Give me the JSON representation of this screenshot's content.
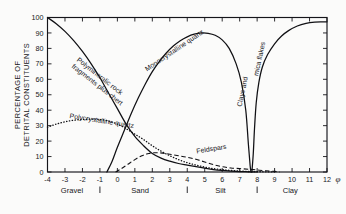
{
  "chart_data": {
    "type": "line",
    "title": "",
    "xlabel": "φ",
    "ylabel": "PERCENTAGE OF DETRITAL CONSTITUENTS",
    "ylabel_line1": "PERCENTAGE OF",
    "ylabel_line2": "DETRITAL CONSTITUENTS",
    "xlim": [
      -4,
      12
    ],
    "ylim": [
      0,
      100
    ],
    "xticks": [
      -4,
      -3,
      -2,
      -1,
      0,
      1,
      2,
      3,
      4,
      5,
      6,
      7,
      8,
      9,
      10,
      11,
      12
    ],
    "xtick_labels": [
      "-4",
      "-3",
      "-2",
      "-1",
      "0",
      "1",
      "2",
      "3",
      "4",
      "5",
      "6",
      "7",
      "8",
      "9",
      "10",
      "11",
      "12"
    ],
    "yticks": [
      0,
      10,
      20,
      30,
      40,
      50,
      60,
      70,
      80,
      90,
      100
    ],
    "ytick_labels": [
      "0",
      "10",
      "20",
      "30",
      "40",
      "50",
      "60",
      "70",
      "80",
      "90",
      "100"
    ],
    "grid": false,
    "legend": "inline-curve-labels",
    "size_classes": [
      {
        "name": "Gravel",
        "phi_from": -4,
        "phi_to": -1,
        "label_phi": -2.6
      },
      {
        "name": "Sand",
        "phi_from": -1,
        "phi_to": 4,
        "label_phi": 1.3
      },
      {
        "name": "Silt",
        "phi_from": 4,
        "phi_to": 8,
        "label_phi": 5.9
      },
      {
        "name": "Clay",
        "phi_from": 8,
        "phi_to": 12,
        "label_phi": 9.9
      }
    ],
    "series": [
      {
        "name": "Polymineralic rock fragments plus chert",
        "style": "solid",
        "label_lines": [
          "Polymineralic rock",
          "fragments plus chert"
        ],
        "label_phi": -2.35,
        "label_pct": 72,
        "label_rotation": 38,
        "points": [
          [
            -4,
            100
          ],
          [
            -3.5,
            96
          ],
          [
            -3,
            91
          ],
          [
            -2.5,
            85
          ],
          [
            -2,
            78
          ],
          [
            -1.5,
            70
          ],
          [
            -1,
            61
          ],
          [
            -0.5,
            51
          ],
          [
            0,
            41
          ],
          [
            0.5,
            31
          ],
          [
            1,
            23
          ],
          [
            1.5,
            17
          ],
          [
            2,
            12
          ],
          [
            2.5,
            9
          ],
          [
            3,
            7
          ],
          [
            3.5,
            5.5
          ],
          [
            4,
            4.5
          ],
          [
            4.5,
            3.5
          ],
          [
            5,
            2.5
          ],
          [
            5.5,
            1.6
          ],
          [
            6,
            1.0
          ],
          [
            6.5,
            0.6
          ],
          [
            7,
            0.3
          ],
          [
            7.5,
            0.15
          ],
          [
            8,
            0
          ]
        ]
      },
      {
        "name": "Monocrystalline quartz",
        "style": "solid",
        "label_lines": [
          "Monocrystalline quartz"
        ],
        "label_phi": 1.7,
        "label_pct": 65,
        "label_rotation": -34,
        "points": [
          [
            -0.6,
            0
          ],
          [
            -0.3,
            7
          ],
          [
            0,
            16
          ],
          [
            0.4,
            27
          ],
          [
            0.8,
            38
          ],
          [
            1.2,
            48
          ],
          [
            1.6,
            57
          ],
          [
            2,
            65
          ],
          [
            2.4,
            71.5
          ],
          [
            2.8,
            77
          ],
          [
            3.2,
            81.5
          ],
          [
            3.6,
            85
          ],
          [
            4,
            87.5
          ],
          [
            4.4,
            89.2
          ],
          [
            4.8,
            90
          ],
          [
            5.2,
            89.8
          ],
          [
            5.6,
            88.5
          ],
          [
            6,
            85.5
          ],
          [
            6.4,
            80
          ],
          [
            6.8,
            70
          ],
          [
            7.1,
            58
          ],
          [
            7.35,
            40
          ],
          [
            7.5,
            18
          ],
          [
            7.6,
            4
          ],
          [
            7.65,
            0
          ]
        ]
      },
      {
        "name": "Polycrystalline quartz",
        "style": "dotted",
        "label_lines": [
          "Polycrystalline quartz"
        ],
        "label_phi": -2.75,
        "label_pct": 35,
        "label_rotation": 9,
        "points": [
          [
            -4,
            29
          ],
          [
            -3.5,
            31
          ],
          [
            -3,
            32.5
          ],
          [
            -2.5,
            33.5
          ],
          [
            -2,
            34
          ],
          [
            -1.5,
            34.2
          ],
          [
            -1,
            34
          ],
          [
            -0.5,
            33
          ],
          [
            0,
            31
          ],
          [
            0.5,
            28
          ],
          [
            1,
            24.5
          ],
          [
            1.5,
            21
          ],
          [
            2,
            17
          ],
          [
            2.5,
            13.5
          ],
          [
            3,
            10.5
          ],
          [
            3.5,
            8
          ],
          [
            4,
            6
          ],
          [
            4.5,
            4.5
          ],
          [
            5,
            3.2
          ],
          [
            5.5,
            2.2
          ],
          [
            6,
            1.5
          ],
          [
            6.5,
            1.0
          ],
          [
            7,
            0.6
          ],
          [
            7.5,
            0.35
          ],
          [
            8,
            0.2
          ],
          [
            8.5,
            0.1
          ],
          [
            9,
            0
          ]
        ]
      },
      {
        "name": "Feldspars",
        "style": "dashed",
        "label_lines": [
          "Feldspars"
        ],
        "label_phi": 4.55,
        "label_pct": 12,
        "label_rotation": -9,
        "points": [
          [
            -0.1,
            0
          ],
          [
            0.2,
            2
          ],
          [
            0.6,
            5
          ],
          [
            1,
            8
          ],
          [
            1.4,
            10.5
          ],
          [
            1.8,
            12
          ],
          [
            2.2,
            12.5
          ],
          [
            2.6,
            12.2
          ],
          [
            3,
            11.5
          ],
          [
            3.5,
            10.5
          ],
          [
            4,
            9.5
          ],
          [
            4.5,
            8.2
          ],
          [
            5,
            6.5
          ],
          [
            5.5,
            4.8
          ],
          [
            6,
            3.4
          ],
          [
            6.5,
            2.6
          ],
          [
            7,
            2.2
          ],
          [
            7.5,
            1.8
          ],
          [
            8,
            1.3
          ],
          [
            8.5,
            0.8
          ],
          [
            9,
            0.4
          ],
          [
            9.3,
            0
          ]
        ]
      },
      {
        "name": "Clays and mica flakes",
        "style": "solid",
        "label_lines": [
          "Clays and"
        ],
        "label_phi": 7.1,
        "label_pct": 42,
        "label_rotation": -78,
        "label2_lines": [
          "mica flakes"
        ],
        "label2_phi": 8.05,
        "label2_pct": 62,
        "label2_rotation": -78,
        "points": [
          [
            7.7,
            0
          ],
          [
            7.78,
            12
          ],
          [
            7.85,
            28
          ],
          [
            7.95,
            45
          ],
          [
            8.1,
            58
          ],
          [
            8.3,
            68
          ],
          [
            8.6,
            76
          ],
          [
            9,
            83
          ],
          [
            9.4,
            88
          ],
          [
            9.8,
            91.5
          ],
          [
            10.3,
            94.5
          ],
          [
            10.8,
            96.2
          ],
          [
            11.3,
            97
          ],
          [
            11.7,
            97.2
          ],
          [
            12,
            97.2
          ]
        ]
      }
    ]
  }
}
